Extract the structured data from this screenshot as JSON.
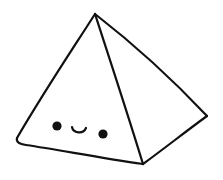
{
  "image": {
    "subject": "kawaii pyramid",
    "description": "Hand-drawn black line-art square pyramid with a cute face (two dot eyes and a small smile) on its left front face",
    "background_color": "#ffffff",
    "line_color": "#111111"
  },
  "pyramid": {
    "vertices": {
      "apex": [
        95,
        14
      ],
      "left": [
        17,
        139
      ],
      "bottom": [
        143,
        164
      ],
      "right": [
        207,
        116
      ]
    }
  },
  "face": {
    "left_eye": {
      "cx": 57,
      "cy": 126,
      "r": 4.6
    },
    "right_eye": {
      "cx": 103,
      "cy": 134,
      "r": 4.6
    },
    "mouth": {
      "start": [
        72,
        127
      ],
      "end": [
        86,
        128
      ],
      "expression": "smile"
    }
  }
}
